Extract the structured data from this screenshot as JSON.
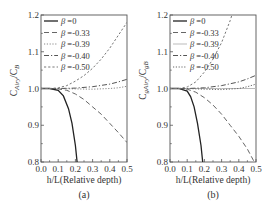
{
  "chart_data": [
    {
      "type": "line",
      "panel_label": "(a)",
      "xlabel": "h/L(Relative depth)",
      "ylabel": "C_Airy/C_B",
      "ylabel_main": "C",
      "ylabel_sub1": "Airy",
      "ylabel_mid": "/C",
      "ylabel_sub2": "B",
      "xlim": [
        0.0,
        0.5
      ],
      "ylim": [
        0.8,
        1.2
      ],
      "xticks": [
        "0.0",
        "0.1",
        "0.2",
        "0.3",
        "0.4",
        "0.5"
      ],
      "yticks": [
        "0.8",
        "0.9",
        "1.0",
        "1.1",
        "1.2"
      ],
      "grid": false,
      "legend_position": "upper left",
      "series": [
        {
          "name": "β =0",
          "style": "solid",
          "color": "#222222",
          "x": [
            0.0,
            0.05,
            0.1,
            0.13,
            0.16,
            0.18,
            0.2,
            0.21
          ],
          "y": [
            1.0,
            1.0,
            0.995,
            0.98,
            0.945,
            0.905,
            0.845,
            0.8
          ]
        },
        {
          "name": "β =-0.33",
          "style": "dash",
          "color": "#666666",
          "x": [
            0.0,
            0.05,
            0.1,
            0.15,
            0.2,
            0.25,
            0.3,
            0.35,
            0.4,
            0.45,
            0.5
          ],
          "y": [
            1.0,
            1.0,
            0.999,
            0.995,
            0.985,
            0.97,
            0.95,
            0.93,
            0.905,
            0.88,
            0.853
          ]
        },
        {
          "name": "β =-0.39",
          "style": "dot",
          "color": "#888888",
          "x": [
            0.0,
            0.1,
            0.2,
            0.3,
            0.4,
            0.45,
            0.5
          ],
          "y": [
            1.0,
            1.0,
            0.999,
            0.998,
            1.0,
            1.002,
            1.006
          ]
        },
        {
          "name": "β =-0.40",
          "style": "dashdot",
          "color": "#555555",
          "x": [
            0.0,
            0.1,
            0.2,
            0.3,
            0.4,
            0.45,
            0.5
          ],
          "y": [
            1.0,
            1.0,
            1.001,
            1.005,
            1.012,
            1.018,
            1.025
          ]
        },
        {
          "name": "β =-0.50",
          "style": "shortdash",
          "color": "#777777",
          "x": [
            0.0,
            0.05,
            0.1,
            0.15,
            0.2,
            0.25,
            0.3,
            0.35,
            0.4,
            0.45,
            0.5
          ],
          "y": [
            1.0,
            1.0,
            1.002,
            1.008,
            1.02,
            1.035,
            1.055,
            1.08,
            1.11,
            1.145,
            1.18
          ]
        }
      ]
    },
    {
      "type": "line",
      "panel_label": "(b)",
      "xlabel": "h/L(Relative depth)",
      "ylabel": "C_gAiry/C_gB",
      "ylabel_main": "C",
      "ylabel_sub1": "gAiry",
      "ylabel_mid": "/C",
      "ylabel_sub2": "gB",
      "xlim": [
        0.0,
        0.5
      ],
      "ylim": [
        0.8,
        1.2
      ],
      "xticks": [
        "0.0",
        "0.1",
        "0.2",
        "0.3",
        "0.4",
        "0.5"
      ],
      "yticks": [
        "0.8",
        "0.9",
        "1.0",
        "1.1",
        "1.2"
      ],
      "grid": false,
      "legend_position": "upper left",
      "series": [
        {
          "name": "β =0",
          "style": "solid",
          "color": "#222222",
          "x": [
            0.0,
            0.05,
            0.1,
            0.12,
            0.14,
            0.16,
            0.18,
            0.19
          ],
          "y": [
            1.0,
            1.0,
            0.993,
            0.978,
            0.95,
            0.905,
            0.845,
            0.8
          ]
        },
        {
          "name": "β =-0.33",
          "style": "dash",
          "color": "#666666",
          "x": [
            0.0,
            0.05,
            0.1,
            0.15,
            0.2,
            0.25,
            0.3,
            0.35,
            0.4,
            0.45,
            0.49
          ],
          "y": [
            1.0,
            1.0,
            0.998,
            0.99,
            0.975,
            0.955,
            0.93,
            0.9,
            0.87,
            0.835,
            0.8
          ]
        },
        {
          "name": "β =-0.39",
          "style": "solid-light",
          "color": "#bbbbbb",
          "x": [
            0.0,
            0.1,
            0.2,
            0.3,
            0.4,
            0.5
          ],
          "y": [
            1.0,
            1.0,
            1.0,
            1.0,
            1.0,
            1.0
          ]
        },
        {
          "name": "β =-0.40",
          "style": "dashdot",
          "color": "#555555",
          "x": [
            0.0,
            0.1,
            0.2,
            0.3,
            0.4,
            0.45,
            0.5
          ],
          "y": [
            1.0,
            1.0,
            1.002,
            1.008,
            1.018,
            1.026,
            1.036
          ]
        },
        {
          "name": "β =-0.50",
          "style": "dot",
          "color": "#666666",
          "x": [
            0.0,
            0.1,
            0.2,
            0.3,
            0.4,
            0.45,
            0.5
          ],
          "y": [
            1.0,
            1.0,
            0.998,
            0.997,
            1.0,
            1.005,
            1.012
          ]
        },
        {
          "name": "(unlabeled steep)",
          "style": "shortdash",
          "color": "#777777",
          "x": [
            0.0,
            0.05,
            0.1,
            0.15,
            0.2,
            0.25,
            0.3,
            0.35,
            0.36
          ],
          "y": [
            1.0,
            1.0,
            1.004,
            1.018,
            1.045,
            1.08,
            1.125,
            1.185,
            1.2
          ]
        }
      ]
    }
  ]
}
